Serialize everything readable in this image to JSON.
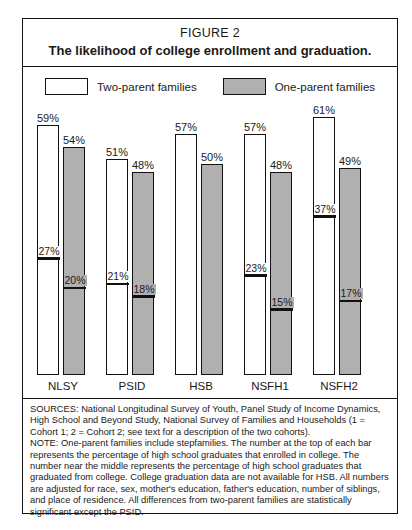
{
  "figure": {
    "number": "FIGURE 2",
    "title": "The likelihood of college enrollment and graduation."
  },
  "legend": {
    "items": [
      {
        "label": "Two-parent families",
        "swatch": "white-swatch",
        "color": "#ffffff"
      },
      {
        "label": "One-parent families",
        "swatch": "gray-swatch",
        "color": "#b0b0b0"
      }
    ]
  },
  "notes": {
    "sources": "SOURCES: National Longitudinal Survey of Youth, Panel Study of Income Dynamics, High School and Beyond Study, National Survey of Families and Households (1 = Cohort 1; 2 = Cohort 2; see text for a description of the two cohorts).",
    "note": "NOTE: One-parent families include stepfamilies. The number at the top of each bar represents the percentage of high school graduates that enrolled in college. The number near the middle represents the percentage of high school graduates that graduated from college. College graduation data are not available for HSB. All numbers are adjusted for race, sex, mother's education, father's education, number of siblings, and place of residence. All differences from two-parent families are statistically significant except the PSID."
  },
  "chart_data": {
    "type": "bar",
    "title": "The likelihood of college enrollment and graduation.",
    "xlabel": "",
    "ylabel": "",
    "ylim": [
      0,
      61
    ],
    "grid": false,
    "legend_position": "top",
    "categories": [
      "NLSY",
      "PSID",
      "HSB",
      "NSFH1",
      "NSFH2"
    ],
    "series": [
      {
        "name": "Two-parent families",
        "color": "#ffffff",
        "enrolled": [
          59,
          51,
          57,
          57,
          61
        ],
        "graduated": [
          27,
          21,
          null,
          23,
          37
        ],
        "enrolled_labels": [
          "59%",
          "51%",
          "57%",
          "57%",
          "61%"
        ],
        "graduated_labels": [
          "27%",
          "21%",
          "",
          "23%",
          "37%"
        ]
      },
      {
        "name": "One-parent families",
        "color": "#b0b0b0",
        "enrolled": [
          54,
          48,
          50,
          48,
          49
        ],
        "graduated": [
          20,
          18,
          null,
          15,
          17
        ],
        "enrolled_labels": [
          "54%",
          "48%",
          "50%",
          "48%",
          "49%"
        ],
        "graduated_labels": [
          "20%",
          "18%",
          "",
          "15%",
          "17%"
        ]
      }
    ]
  }
}
